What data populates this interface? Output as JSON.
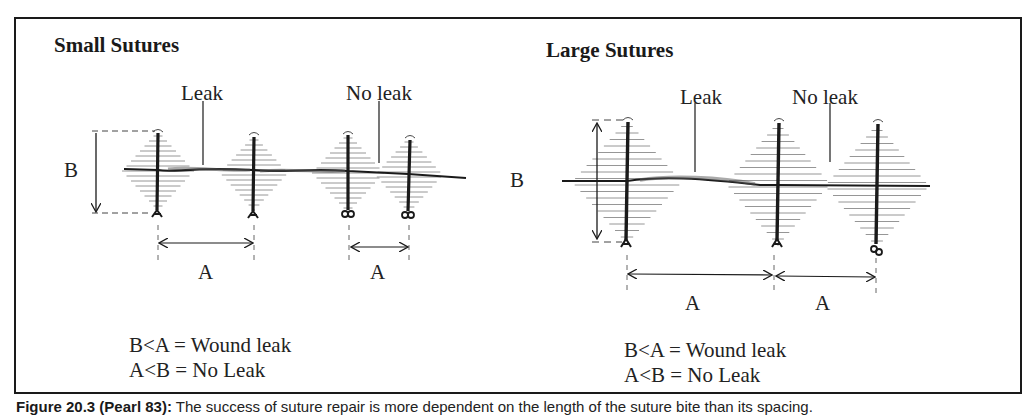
{
  "figure": {
    "caption_label": "Figure 20.3 (Pearl 83):",
    "caption_text": "The success of suture repair is more dependent on the length of the suture bite than its spacing."
  },
  "panels": [
    {
      "title": "Small Sutures",
      "leak_label": "Leak",
      "no_leak_label": "No leak",
      "dimension_b": "B",
      "dimension_a_left": "A",
      "dimension_a_right": "A",
      "rules": [
        "B<A = Wound leak",
        "A<B = No Leak"
      ]
    },
    {
      "title": "Large Sutures",
      "leak_label": "Leak",
      "no_leak_label": "No leak",
      "dimension_b": "B",
      "dimension_a_left": "A",
      "dimension_a_right": "A",
      "rules": [
        "B<A = Wound leak",
        "A<B = No Leak"
      ]
    }
  ],
  "colors": {
    "ink": "#1a1a1a",
    "hatch": "#8a8a8a",
    "background": "#ffffff"
  }
}
